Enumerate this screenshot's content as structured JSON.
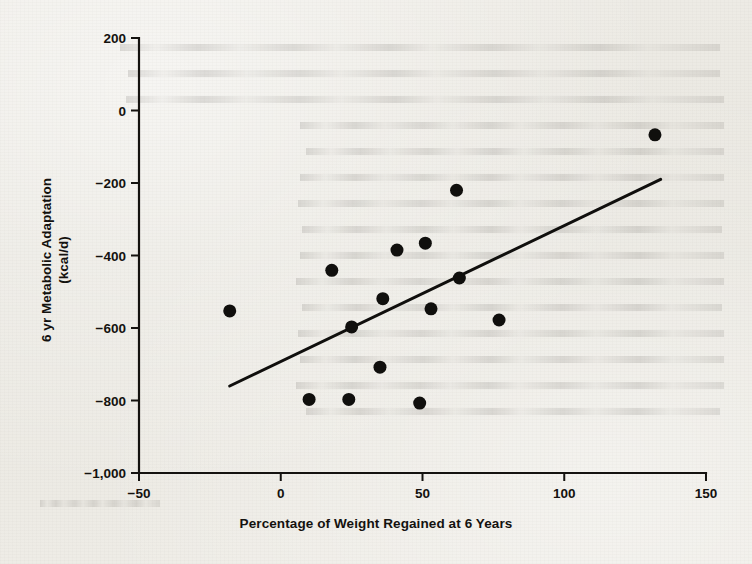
{
  "figure": {
    "background_color": "#eceae4",
    "ink_color": "#14120f"
  },
  "chart_data": {
    "type": "scatter",
    "title": "",
    "xlabel": "Percentage of Weight Regained at 6 Years",
    "ylabel": "6 yr Metabolic Adaptation (kcal/d)",
    "ylabel_line1": "6 yr Metabolic Adaptation",
    "ylabel_line2": "(kcal/d)",
    "xlim": [
      -50,
      150
    ],
    "ylim": [
      -1000,
      200
    ],
    "xticks": [
      -50,
      0,
      50,
      100,
      150
    ],
    "xtick_labels": [
      "−50",
      "0",
      "50",
      "100",
      "150"
    ],
    "yticks": [
      200,
      0,
      -200,
      -400,
      -600,
      -800,
      -1000
    ],
    "ytick_labels": [
      "200",
      "0",
      "−200",
      "−400",
      "−600",
      "−800",
      "−1,000"
    ],
    "grid": false,
    "legend": false,
    "marker": "filled-circle",
    "marker_color": "#100f0d",
    "marker_size_px": 13,
    "points": [
      {
        "x": -18,
        "y": -553
      },
      {
        "x": 10,
        "y": -797
      },
      {
        "x": 18,
        "y": -441
      },
      {
        "x": 24,
        "y": -797
      },
      {
        "x": 25,
        "y": -597
      },
      {
        "x": 35,
        "y": -708
      },
      {
        "x": 36,
        "y": -519
      },
      {
        "x": 41,
        "y": -385
      },
      {
        "x": 49,
        "y": -807
      },
      {
        "x": 51,
        "y": -366
      },
      {
        "x": 53,
        "y": -547
      },
      {
        "x": 62,
        "y": -220
      },
      {
        "x": 63,
        "y": -462
      },
      {
        "x": 77,
        "y": -578
      },
      {
        "x": 132,
        "y": -67
      }
    ],
    "trendline": {
      "type": "linear-fit",
      "x_start": -18,
      "y_start": -760,
      "x_end": 134,
      "y_end": -190,
      "color": "#100f0d",
      "width_px": 3
    }
  },
  "ghost_text": {
    "description": "faint show-through text from reverse of printed page",
    "lines": 14
  }
}
